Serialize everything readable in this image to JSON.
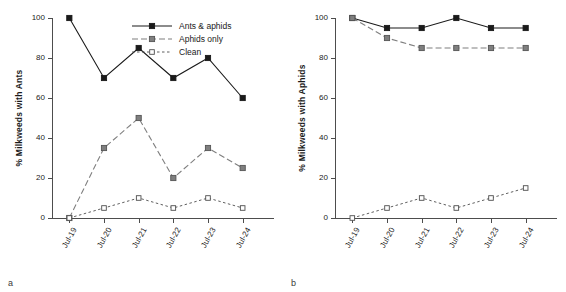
{
  "figure": {
    "panels": [
      {
        "letter": "a",
        "ylabel": "% Milkweeds with Ants",
        "legend_visible": true
      },
      {
        "letter": "b",
        "ylabel": "% Milkweeds with Aphids",
        "legend_visible": false
      }
    ]
  },
  "legend": {
    "items": [
      {
        "label": "Ants & aphids",
        "marker": "filled-square-black",
        "line": "solid",
        "color": "#1a1a1a"
      },
      {
        "label": "Aphids only",
        "marker": "filled-square-gray",
        "line": "dashed",
        "color": "#808080"
      },
      {
        "label": "Clean",
        "marker": "open-square-white",
        "line": "dotted",
        "color": "#ffffff"
      }
    ]
  },
  "colors": {
    "ants_aphids": "#1a1a1a",
    "aphids_only": "#7f7f7f",
    "clean_fill": "#ffffff",
    "clean_edge": "#4d4d4d",
    "axis": "#4d4d4d",
    "text": "#1a1a1a",
    "background": "#ffffff"
  },
  "chart_data": [
    {
      "type": "line",
      "title": "",
      "panel": "a",
      "xlabel": "",
      "ylabel": "% Milkweeds with Ants",
      "categories": [
        "Jul-19",
        "Jul-20",
        "Jul-21",
        "Jul-22",
        "Jul-23",
        "Jul-24"
      ],
      "ylim": [
        0,
        100
      ],
      "yticks": [
        0,
        20,
        40,
        60,
        80,
        100
      ],
      "ytick_labels": [
        "0",
        "20",
        "40",
        "60",
        "80",
        "100"
      ],
      "grid": false,
      "legend_position": "top-right",
      "series": [
        {
          "name": "Ants & aphids",
          "values": [
            100,
            70,
            85,
            70,
            80,
            60
          ],
          "line": "solid",
          "marker": "filled-square-black"
        },
        {
          "name": "Aphids only",
          "values": [
            0,
            35,
            50,
            20,
            35,
            25
          ],
          "line": "dashed",
          "marker": "filled-square-gray"
        },
        {
          "name": "Clean",
          "values": [
            0,
            5,
            10,
            5,
            10,
            5
          ],
          "line": "dotted",
          "marker": "open-square-white"
        }
      ]
    },
    {
      "type": "line",
      "title": "",
      "panel": "b",
      "xlabel": "",
      "ylabel": "% Milkweeds with Aphids",
      "categories": [
        "Jul-19",
        "Jul-20",
        "Jul-21",
        "Jul-22",
        "Jul-23",
        "Jul-24"
      ],
      "ylim": [
        0,
        100
      ],
      "yticks": [
        0,
        20,
        40,
        60,
        80,
        100
      ],
      "ytick_labels": [
        "0",
        "20",
        "40",
        "60",
        "80",
        "100"
      ],
      "grid": false,
      "legend_position": "none",
      "series": [
        {
          "name": "Ants & aphids",
          "values": [
            100,
            95,
            95,
            100,
            95,
            95
          ],
          "line": "solid",
          "marker": "filled-square-black"
        },
        {
          "name": "Aphids only",
          "values": [
            100,
            90,
            85,
            85,
            85,
            85
          ],
          "line": "dashed",
          "marker": "filled-square-gray"
        },
        {
          "name": "Clean",
          "values": [
            0,
            5,
            10,
            5,
            10,
            15
          ],
          "line": "dotted",
          "marker": "open-square-white"
        }
      ]
    }
  ]
}
